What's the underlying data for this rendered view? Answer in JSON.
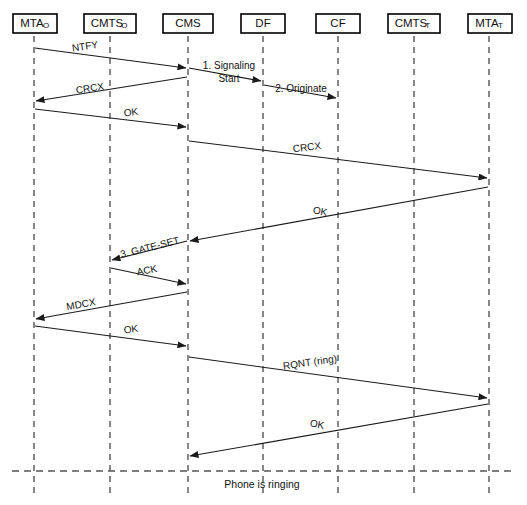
{
  "diagram": {
    "width": 527,
    "height": 505,
    "background_color": "#ffffff",
    "line_color": "#1a1a1a",
    "lifeline_color": "#555555"
  },
  "lifelines": [
    {
      "id": "mta_o",
      "label": "MTA",
      "subscript": "O",
      "x": 34,
      "box_x": 13,
      "box_w": 44
    },
    {
      "id": "cmts_o",
      "label": "CMTS",
      "subscript": "O",
      "x": 110,
      "box_x": 84,
      "box_w": 52
    },
    {
      "id": "cms",
      "label": "CMS",
      "subscript": "",
      "x": 188,
      "box_x": 163,
      "box_w": 50
    },
    {
      "id": "df",
      "label": "DF",
      "subscript": "",
      "x": 263,
      "box_x": 241,
      "box_w": 44
    },
    {
      "id": "cf",
      "label": "CF",
      "subscript": "",
      "x": 338,
      "box_x": 316,
      "box_w": 44
    },
    {
      "id": "cmts_t",
      "label": "CMTS",
      "subscript": "T",
      "x": 414,
      "box_x": 388,
      "box_w": 52
    },
    {
      "id": "mta_t",
      "label": "MTA",
      "subscript": "T",
      "x": 489,
      "box_x": 468,
      "box_w": 44
    }
  ],
  "lifeline_geometry": {
    "box_top": 14,
    "box_height": 19,
    "line_top": 36,
    "line_bottom": 495
  },
  "messages": [
    {
      "id": "m1",
      "label": "NTFY",
      "from": "mta_o",
      "to": "cms",
      "y_from": 48,
      "y_to": 68,
      "label_x": 85,
      "label_y": 47,
      "label_rotate": -8,
      "multiline": false
    },
    {
      "id": "m2",
      "label": "1. Signaling",
      "label2": "Start",
      "from": "cms",
      "to": "df",
      "y_from": 68,
      "y_to": 81,
      "label_x": 229,
      "label_y": 66,
      "label_rotate": 0,
      "multiline": true
    },
    {
      "id": "m3",
      "label": "2. Originate",
      "from": "df",
      "to": "cf",
      "y_from": 85,
      "y_to": 98,
      "label_x": 301,
      "label_y": 89,
      "label_rotate": 0,
      "multiline": false
    },
    {
      "id": "m4",
      "label": "CRCX",
      "from": "cms",
      "to": "mta_o",
      "y_from": 77,
      "y_to": 101,
      "label_x": 90,
      "label_y": 89,
      "label_rotate": -9,
      "multiline": false
    },
    {
      "id": "m5",
      "label": "OK",
      "from": "mta_o",
      "to": "cms",
      "y_from": 109,
      "y_to": 127,
      "label_x": 131,
      "label_y": 113,
      "label_rotate": -7,
      "multiline": false
    },
    {
      "id": "m6",
      "label": "CRCX",
      "from": "cms",
      "to": "mta_t",
      "y_from": 141,
      "y_to": 178,
      "label_x": 307,
      "label_y": 148,
      "label_rotate": -7,
      "multiline": false
    },
    {
      "id": "m7",
      "label": "OK",
      "from": "mta_t",
      "to": "cms",
      "y_from": 187,
      "y_to": 241,
      "label_x": 320,
      "label_y": 212,
      "label_rotate": 10,
      "multiline": false
    },
    {
      "id": "m8",
      "label": "3. GATE-SET",
      "from": "cms",
      "to": "cmts_o",
      "y_from": 241,
      "y_to": 260,
      "label_x": 150,
      "label_y": 248,
      "label_rotate": -14,
      "multiline": false
    },
    {
      "id": "m9",
      "label": "ACK",
      "from": "cmts_o",
      "to": "cms",
      "y_from": 268,
      "y_to": 284,
      "label_x": 147,
      "label_y": 271,
      "label_rotate": -11,
      "multiline": false
    },
    {
      "id": "m10",
      "label": "MDCX",
      "from": "cms",
      "to": "mta_o",
      "y_from": 292,
      "y_to": 319,
      "label_x": 81,
      "label_y": 305,
      "label_rotate": -10,
      "multiline": false
    },
    {
      "id": "m11",
      "label": "OK",
      "from": "mta_o",
      "to": "cms",
      "y_from": 326,
      "y_to": 346,
      "label_x": 131,
      "label_y": 330,
      "label_rotate": -7,
      "multiline": false
    },
    {
      "id": "m12",
      "label": "RQNT (ring)",
      "from": "cms",
      "to": "mta_t",
      "y_from": 357,
      "y_to": 398,
      "label_x": 310,
      "label_y": 363,
      "label_rotate": -8,
      "multiline": false
    },
    {
      "id": "m13",
      "label": "OK",
      "from": "mta_t",
      "to": "cms",
      "y_from": 404,
      "y_to": 456,
      "label_x": 317,
      "label_y": 425,
      "label_rotate": 10,
      "multiline": false
    }
  ],
  "phase_divider": {
    "label": "Phone is ringing",
    "y": 471,
    "x_start": 12,
    "x_end": 515,
    "label_x": 262,
    "label_y": 485
  }
}
